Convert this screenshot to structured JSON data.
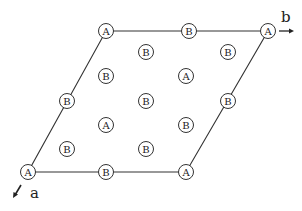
{
  "diagram": {
    "type": "2D lattice unit cell",
    "axis_labels": {
      "a": "a",
      "b": "b"
    },
    "cell_vertices": [
      [
        106,
        31
      ],
      [
        268,
        31
      ],
      [
        186,
        172
      ],
      [
        28,
        172
      ]
    ],
    "atoms": [
      {
        "label": "A",
        "x": 106,
        "y": 31
      },
      {
        "label": "B",
        "x": 189,
        "y": 31
      },
      {
        "label": "A",
        "x": 268,
        "y": 31
      },
      {
        "label": "B",
        "x": 146,
        "y": 52
      },
      {
        "label": "B",
        "x": 228,
        "y": 52
      },
      {
        "label": "B",
        "x": 106,
        "y": 76
      },
      {
        "label": "A",
        "x": 186,
        "y": 76
      },
      {
        "label": "B",
        "x": 67,
        "y": 101
      },
      {
        "label": "B",
        "x": 146,
        "y": 101
      },
      {
        "label": "B",
        "x": 228,
        "y": 101
      },
      {
        "label": "A",
        "x": 106,
        "y": 125
      },
      {
        "label": "B",
        "x": 186,
        "y": 125
      },
      {
        "label": "B",
        "x": 67,
        "y": 149
      },
      {
        "label": "B",
        "x": 146,
        "y": 149
      },
      {
        "label": "A",
        "x": 28,
        "y": 172
      },
      {
        "label": "B",
        "x": 106,
        "y": 172
      },
      {
        "label": "A",
        "x": 186,
        "y": 172
      }
    ]
  }
}
